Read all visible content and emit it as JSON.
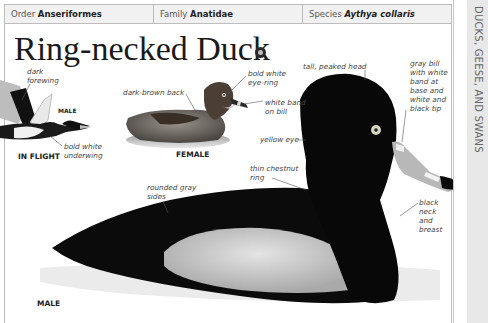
{
  "header": {
    "order_label": "Order",
    "order_value": "Anseriformes",
    "family_label": "Family",
    "family_value": "Anatidae",
    "species_label": "Species",
    "species_value": "Aythya collaris"
  },
  "title": "Ring-necked Duck",
  "audio_icon": "speaker-icon",
  "side_tab": "DUCKS, GEESE, AND SWANS",
  "illustrations": {
    "in_flight": {
      "caption": "IN FLIGHT",
      "sex_label": "MALE",
      "annotations": [
        "dark forewing",
        "bold white underwing"
      ]
    },
    "female": {
      "caption": "FEMALE",
      "annotations": [
        "dark-brown back",
        "bold white eye-ring",
        "white band on bill"
      ]
    },
    "male": {
      "caption": "MALE",
      "annotations": [
        "tall, peaked head",
        "gray bill with white band at base and white and black tip",
        "yellow eye",
        "thin chestnut ring",
        "rounded gray sides",
        "black neck and breast"
      ]
    }
  },
  "annotation_lines": {
    "dark_forewing_1": "dark",
    "dark_forewing_2": "forewing",
    "underwing_1": "bold white",
    "underwing_2": "underwing",
    "back": "dark-brown back",
    "eyering_1": "bold white",
    "eyering_2": "eye-ring",
    "band_1": "white band",
    "band_2": "on bill",
    "head": "tall, peaked head",
    "bill_1": "gray bill",
    "bill_2": "with white",
    "bill_3": "band at",
    "bill_4": "base and",
    "bill_5": "white and",
    "bill_6": "black tip",
    "eye": "yellow eye",
    "ring_1": "thin chestnut",
    "ring_2": "ring",
    "sides_1": "rounded gray",
    "sides_2": "sides",
    "neck_1": "black",
    "neck_2": "neck",
    "neck_3": "and",
    "neck_4": "breast"
  },
  "colors": {
    "header_bg": "#f1f1f1",
    "border": "#bdbdbd",
    "side_tab_bg": "#e8e8e8",
    "side_tab_text": "#666666",
    "title": "#1a1a1a"
  }
}
